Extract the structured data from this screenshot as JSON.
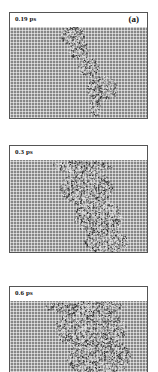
{
  "figure": {
    "panels": [
      {
        "time_label": "0.19 ps",
        "tag": "(a)",
        "top": 12,
        "height": 107
      },
      {
        "time_label": "0.3 ps",
        "tag": "",
        "top": 145,
        "height": 108
      },
      {
        "time_label": "0.6 ps",
        "tag": "",
        "top": 286,
        "height": 90
      }
    ]
  },
  "colors": {
    "lattice": "#878787",
    "grid_lines": "#d8d8d8",
    "frame": "#555555",
    "disorder_light": "#e6e6e6",
    "disorder_dark": "#2a2a2a"
  }
}
